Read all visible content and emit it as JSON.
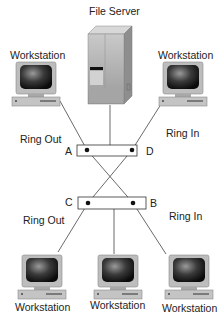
{
  "diagram": {
    "title": "File Server",
    "server": {
      "label": "File Server"
    },
    "workstations": [
      {
        "id": "ws-top-left",
        "label": "Workstation"
      },
      {
        "id": "ws-top-right",
        "label": "Workstation"
      },
      {
        "id": "ws-bottom-left",
        "label": "Workstation"
      },
      {
        "id": "ws-bottom-center",
        "label": "Workstation"
      },
      {
        "id": "ws-bottom-right",
        "label": "Workstation"
      }
    ],
    "ring_labels": {
      "top_left": "Ring Out",
      "top_right": "Ring In",
      "bottom_left": "Ring Out",
      "bottom_right": "Ring In"
    },
    "ports": {
      "a": "A",
      "b": "B",
      "c": "C",
      "d": "D"
    },
    "connections": [
      [
        "ws-top-left",
        "A"
      ],
      [
        "server",
        "top-hub"
      ],
      [
        "ws-top-right",
        "D"
      ],
      [
        "A",
        "B"
      ],
      [
        "D",
        "C"
      ],
      [
        "C",
        "ws-bottom-left"
      ],
      [
        "bottom-hub",
        "ws-bottom-center"
      ],
      [
        "B",
        "ws-bottom-right"
      ]
    ]
  }
}
